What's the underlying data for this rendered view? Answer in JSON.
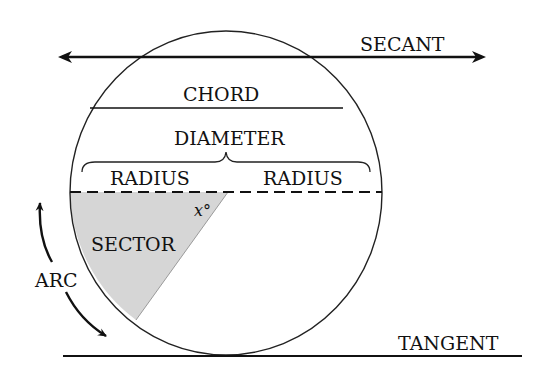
{
  "diagram": {
    "labels": {
      "secant": "SECANT",
      "chord": "CHORD",
      "diameter": "DIAMETER",
      "radius_left": "RADIUS",
      "radius_right": "RADIUS",
      "sector": "SECTOR",
      "angle": "x°",
      "arc": "ARC",
      "tangent": "TANGENT"
    },
    "colors": {
      "stroke": "#111111",
      "sector_fill": "#d6d6d6",
      "background": "#ffffff"
    }
  }
}
